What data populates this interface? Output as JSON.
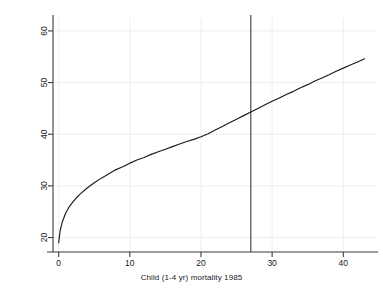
{
  "figure": {
    "background_color": "#ffffff",
    "axis_color": "#3a3a3a",
    "grid_color": "#eceef1",
    "curve_color": "#1a1a1a",
    "refline_color": "#4a4a4a"
  },
  "labels": {
    "ylabel": "birth = f(childmort | loggnp = 3.09)",
    "xlabel": "Child (1-4 yr) mortality 1985"
  },
  "chart_data": {
    "type": "line",
    "title": "",
    "xlabel": "Child (1-4 yr) mortality 1985",
    "ylabel": "birth = f(childmort | loggnp = 3.09)",
    "xlim": [
      -0.8,
      44.6
    ],
    "ylim": [
      17.2,
      62.5
    ],
    "xticks": [
      0,
      10,
      20,
      30,
      40
    ],
    "yticks": [
      20,
      30,
      40,
      50,
      60
    ],
    "xtick_labels": [
      "0",
      "10",
      "20",
      "30",
      "40"
    ],
    "ytick_labels": [
      "20",
      "30",
      "40",
      "50",
      "60"
    ],
    "grid": true,
    "legend": null,
    "series": [
      {
        "name": "birth = f(childmort | loggnp = 3.09)",
        "x": [
          0.0,
          0.2,
          0.5,
          1.0,
          1.5,
          2.0,
          2.5,
          3.0,
          4.0,
          5.0,
          6.0,
          7.0,
          8.0,
          9.0,
          10.0,
          11.0,
          12.0,
          13.0,
          14.0,
          15.0,
          16.0,
          17.0,
          18.0,
          19.0,
          20.0,
          21.0,
          22.0,
          23.0,
          24.0,
          25.0,
          26.0,
          27.0,
          28.0,
          29.0,
          30.0,
          31.0,
          32.0,
          33.0,
          34.0,
          35.0,
          36.0,
          37.0,
          38.0,
          39.0,
          40.0,
          41.0,
          42.0,
          43.0
        ],
        "y": [
          19.0,
          21.3,
          23.0,
          24.8,
          26.0,
          26.9,
          27.7,
          28.4,
          29.6,
          30.6,
          31.5,
          32.3,
          33.1,
          33.7,
          34.4,
          35.0,
          35.5,
          36.1,
          36.6,
          37.1,
          37.6,
          38.1,
          38.6,
          39.0,
          39.5,
          40.1,
          40.8,
          41.5,
          42.2,
          42.9,
          43.6,
          44.3,
          45.0,
          45.7,
          46.4,
          47.0,
          47.7,
          48.3,
          49.0,
          49.6,
          50.3,
          50.9,
          51.5,
          52.2,
          52.8,
          53.4,
          54.0,
          54.6
        ],
        "color": "#1a1a1a"
      }
    ],
    "reference_lines": [
      {
        "orientation": "vertical",
        "value": 27,
        "color": "#4a4a4a"
      }
    ]
  }
}
